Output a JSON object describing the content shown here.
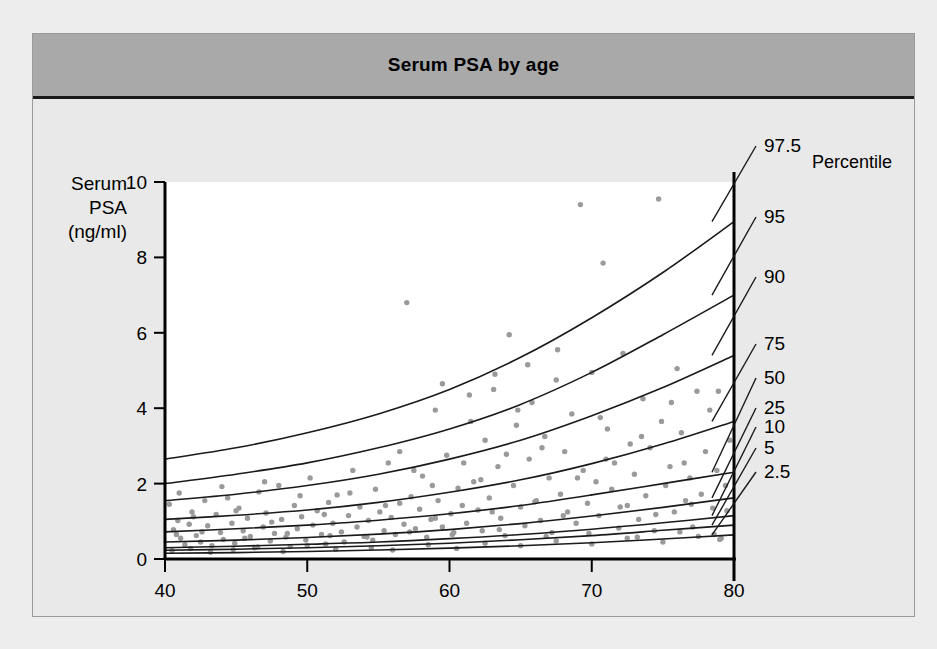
{
  "figure": {
    "title": "Serum PSA by age",
    "background": "#e9e9e9",
    "title_bar_color": "#a9a9a9"
  },
  "chart_data": {
    "type": "scatter",
    "title": "Serum PSA by age",
    "xlabel": "Age (years)",
    "ylabel": "Serum PSA (ng/ml)",
    "ylabel_lines": [
      "Serum",
      "PSA",
      "(ng/ml)"
    ],
    "xlim": [
      40,
      80
    ],
    "ylim": [
      0,
      10
    ],
    "xticks": [
      40,
      50,
      60,
      70,
      80
    ],
    "yticks": [
      0,
      2,
      4,
      6,
      8,
      10
    ],
    "grid": false,
    "legend_position": "right-outside",
    "legend_title": "Percentile",
    "point_color": "#9a9a9a",
    "curve_color": "#1a1a1a",
    "series": [
      {
        "name": "97.5",
        "label": "97.5",
        "x": [
          40,
          45,
          50,
          55,
          60,
          65,
          70,
          75,
          80
        ],
        "values": [
          2.65,
          2.95,
          3.35,
          3.85,
          4.5,
          5.35,
          6.4,
          7.6,
          8.95
        ]
      },
      {
        "name": "95",
        "label": "95",
        "x": [
          40,
          45,
          50,
          55,
          60,
          65,
          70,
          75,
          80
        ],
        "values": [
          2.0,
          2.25,
          2.55,
          2.95,
          3.45,
          4.1,
          4.95,
          5.95,
          7.0
        ]
      },
      {
        "name": "90",
        "label": "90",
        "x": [
          40,
          45,
          50,
          55,
          60,
          65,
          70,
          75,
          80
        ],
        "values": [
          1.55,
          1.72,
          1.95,
          2.25,
          2.65,
          3.15,
          3.8,
          4.55,
          5.4
        ]
      },
      {
        "name": "75",
        "label": "75",
        "x": [
          40,
          45,
          50,
          55,
          60,
          65,
          70,
          75,
          80
        ],
        "values": [
          1.05,
          1.16,
          1.3,
          1.5,
          1.77,
          2.1,
          2.53,
          3.05,
          3.65
        ]
      },
      {
        "name": "50",
        "label": "50",
        "x": [
          40,
          45,
          50,
          55,
          60,
          65,
          70,
          75,
          80
        ],
        "values": [
          0.72,
          0.8,
          0.9,
          1.03,
          1.2,
          1.42,
          1.7,
          2.0,
          2.3
        ]
      },
      {
        "name": "25",
        "label": "25",
        "x": [
          40,
          45,
          50,
          55,
          60,
          65,
          70,
          75,
          80
        ],
        "values": [
          0.45,
          0.5,
          0.57,
          0.66,
          0.78,
          0.94,
          1.14,
          1.37,
          1.62
        ]
      },
      {
        "name": "10",
        "label": "10",
        "x": [
          40,
          45,
          50,
          55,
          60,
          65,
          70,
          75,
          80
        ],
        "values": [
          0.3,
          0.34,
          0.39,
          0.45,
          0.54,
          0.65,
          0.79,
          0.96,
          1.15
        ]
      },
      {
        "name": "5",
        "label": "5",
        "x": [
          40,
          45,
          50,
          55,
          60,
          65,
          70,
          75,
          80
        ],
        "values": [
          0.23,
          0.26,
          0.3,
          0.35,
          0.42,
          0.51,
          0.62,
          0.76,
          0.9
        ]
      },
      {
        "name": "2.5",
        "label": "2.5",
        "x": [
          40,
          45,
          50,
          55,
          60,
          65,
          70,
          75,
          80
        ],
        "values": [
          0.15,
          0.17,
          0.2,
          0.24,
          0.29,
          0.35,
          0.43,
          0.53,
          0.64
        ]
      }
    ],
    "scatter_points": [
      [
        40.3,
        1.45
      ],
      [
        40.6,
        0.78
      ],
      [
        40.9,
        1.02
      ],
      [
        41.1,
        0.55
      ],
      [
        41.4,
        0.38
      ],
      [
        41.7,
        0.92
      ],
      [
        41.9,
        1.25
      ],
      [
        42.2,
        0.62
      ],
      [
        42.5,
        0.45
      ],
      [
        42.8,
        1.55
      ],
      [
        43.0,
        0.88
      ],
      [
        43.3,
        0.35
      ],
      [
        43.6,
        1.18
      ],
      [
        43.9,
        0.7
      ],
      [
        44.1,
        0.52
      ],
      [
        44.4,
        1.62
      ],
      [
        44.7,
        0.95
      ],
      [
        44.9,
        0.42
      ],
      [
        45.2,
        1.35
      ],
      [
        45.5,
        0.75
      ],
      [
        45.8,
        1.08
      ],
      [
        46.0,
        0.6
      ],
      [
        46.3,
        0.3
      ],
      [
        46.6,
        1.78
      ],
      [
        46.9,
        0.85
      ],
      [
        47.1,
        1.22
      ],
      [
        47.4,
        0.48
      ],
      [
        47.7,
        0.68
      ],
      [
        48.0,
        1.95
      ],
      [
        48.2,
        1.05
      ],
      [
        48.5,
        0.58
      ],
      [
        48.8,
        0.33
      ],
      [
        49.1,
        1.42
      ],
      [
        49.3,
        0.8
      ],
      [
        49.6,
        1.12
      ],
      [
        49.9,
        0.5
      ],
      [
        50.2,
        2.15
      ],
      [
        50.4,
        0.9
      ],
      [
        50.7,
        1.28
      ],
      [
        51.0,
        0.65
      ],
      [
        51.3,
        0.4
      ],
      [
        51.5,
        1.5
      ],
      [
        51.8,
        0.95
      ],
      [
        52.1,
        1.7
      ],
      [
        52.4,
        0.72
      ],
      [
        52.6,
        0.45
      ],
      [
        52.9,
        1.15
      ],
      [
        53.2,
        2.35
      ],
      [
        53.5,
        0.85
      ],
      [
        53.7,
        1.38
      ],
      [
        54.0,
        0.6
      ],
      [
        54.3,
        1.02
      ],
      [
        54.6,
        0.5
      ],
      [
        54.8,
        1.85
      ],
      [
        55.1,
        1.25
      ],
      [
        55.4,
        0.75
      ],
      [
        55.7,
        2.55
      ],
      [
        55.9,
        1.1
      ],
      [
        56.2,
        0.65
      ],
      [
        56.5,
        1.48
      ],
      [
        56.8,
        0.92
      ],
      [
        57.0,
        6.8
      ],
      [
        57.3,
        1.65
      ],
      [
        57.6,
        0.8
      ],
      [
        57.9,
        1.32
      ],
      [
        58.1,
        2.2
      ],
      [
        58.4,
        0.58
      ],
      [
        58.7,
        1.05
      ],
      [
        59.0,
        3.95
      ],
      [
        59.2,
        1.55
      ],
      [
        59.5,
        0.85
      ],
      [
        59.8,
        2.75
      ],
      [
        60.1,
        1.2
      ],
      [
        60.3,
        0.7
      ],
      [
        60.6,
        1.88
      ],
      [
        60.9,
        1.42
      ],
      [
        61.2,
        0.95
      ],
      [
        61.4,
        4.35
      ],
      [
        61.7,
        2.05
      ],
      [
        62.0,
        1.3
      ],
      [
        62.3,
        0.75
      ],
      [
        62.5,
        3.15
      ],
      [
        62.8,
        1.62
      ],
      [
        63.1,
        4.5
      ],
      [
        63.4,
        2.45
      ],
      [
        63.6,
        1.08
      ],
      [
        63.9,
        0.62
      ],
      [
        64.2,
        5.95
      ],
      [
        64.5,
        1.95
      ],
      [
        64.7,
        3.55
      ],
      [
        65.0,
        1.38
      ],
      [
        65.3,
        0.88
      ],
      [
        65.6,
        2.65
      ],
      [
        65.8,
        4.15
      ],
      [
        66.1,
        1.55
      ],
      [
        66.4,
        1.02
      ],
      [
        66.7,
        3.25
      ],
      [
        67.0,
        2.15
      ],
      [
        67.2,
        0.7
      ],
      [
        67.5,
        4.75
      ],
      [
        67.8,
        1.72
      ],
      [
        68.1,
        2.85
      ],
      [
        68.3,
        1.25
      ],
      [
        68.6,
        3.85
      ],
      [
        68.9,
        0.95
      ],
      [
        69.2,
        9.4
      ],
      [
        69.4,
        2.35
      ],
      [
        69.7,
        1.48
      ],
      [
        70.0,
        4.95
      ],
      [
        70.3,
        2.05
      ],
      [
        70.5,
        1.15
      ],
      [
        70.8,
        7.85
      ],
      [
        71.1,
        3.45
      ],
      [
        71.4,
        1.85
      ],
      [
        71.6,
        2.55
      ],
      [
        71.9,
        0.82
      ],
      [
        72.2,
        5.45
      ],
      [
        72.5,
        1.42
      ],
      [
        72.7,
        3.05
      ],
      [
        73.0,
        2.25
      ],
      [
        73.3,
        1.05
      ],
      [
        73.6,
        4.25
      ],
      [
        73.8,
        1.68
      ],
      [
        74.1,
        2.95
      ],
      [
        74.4,
        0.75
      ],
      [
        74.7,
        9.55
      ],
      [
        74.9,
        3.65
      ],
      [
        75.2,
        1.95
      ],
      [
        75.5,
        2.45
      ],
      [
        75.8,
        1.25
      ],
      [
        76.0,
        5.05
      ],
      [
        76.3,
        3.35
      ],
      [
        76.6,
        1.55
      ],
      [
        76.9,
        2.15
      ],
      [
        77.1,
        0.85
      ],
      [
        77.4,
        4.45
      ],
      [
        77.7,
        1.72
      ],
      [
        78.0,
        2.85
      ],
      [
        78.3,
        3.95
      ],
      [
        78.5,
        1.35
      ],
      [
        78.8,
        2.35
      ],
      [
        79.1,
        0.55
      ],
      [
        79.4,
        1.95
      ],
      [
        79.7,
        3.15
      ],
      [
        40.5,
        0.22
      ],
      [
        41.8,
        0.28
      ],
      [
        43.2,
        0.18
      ],
      [
        44.8,
        0.25
      ],
      [
        46.5,
        0.32
      ],
      [
        48.3,
        0.2
      ],
      [
        50.0,
        0.35
      ],
      [
        52.0,
        0.26
      ],
      [
        54.5,
        0.3
      ],
      [
        56.0,
        0.24
      ],
      [
        58.5,
        0.38
      ],
      [
        60.5,
        0.28
      ],
      [
        62.5,
        0.42
      ],
      [
        65.0,
        0.35
      ],
      [
        67.5,
        0.48
      ],
      [
        70.0,
        0.4
      ],
      [
        72.5,
        0.55
      ],
      [
        75.0,
        0.45
      ],
      [
        77.5,
        0.6
      ],
      [
        79.0,
        0.52
      ],
      [
        41.0,
        1.75
      ],
      [
        44.0,
        1.92
      ],
      [
        47.0,
        2.05
      ],
      [
        49.5,
        1.68
      ],
      [
        53.0,
        1.75
      ],
      [
        57.5,
        2.35
      ],
      [
        61.0,
        2.55
      ],
      [
        64.0,
        2.78
      ],
      [
        66.5,
        2.95
      ],
      [
        69.0,
        2.15
      ],
      [
        71.0,
        2.65
      ],
      [
        73.5,
        3.25
      ],
      [
        76.5,
        2.55
      ],
      [
        78.9,
        4.45
      ],
      [
        42.0,
        1.12
      ],
      [
        45.0,
        1.28
      ],
      [
        47.5,
        0.98
      ],
      [
        51.2,
        1.18
      ],
      [
        55.5,
        1.42
      ],
      [
        59.0,
        1.08
      ],
      [
        63.0,
        1.25
      ],
      [
        66.0,
        1.52
      ],
      [
        68.0,
        1.15
      ],
      [
        72.0,
        1.38
      ],
      [
        74.5,
        1.18
      ],
      [
        77.0,
        1.45
      ],
      [
        79.5,
        1.28
      ],
      [
        40.8,
        0.65
      ],
      [
        42.6,
        0.72
      ],
      [
        45.6,
        0.55
      ],
      [
        48.6,
        0.68
      ],
      [
        51.6,
        0.62
      ],
      [
        54.2,
        0.58
      ],
      [
        57.2,
        0.72
      ],
      [
        60.2,
        0.65
      ],
      [
        63.5,
        0.78
      ],
      [
        66.8,
        0.6
      ],
      [
        69.8,
        0.68
      ],
      [
        73.2,
        0.58
      ],
      [
        76.2,
        0.72
      ],
      [
        78.6,
        0.65
      ],
      [
        59.5,
        4.65
      ],
      [
        63.2,
        4.9
      ],
      [
        64.8,
        3.95
      ],
      [
        67.6,
        5.55
      ],
      [
        70.6,
        3.75
      ],
      [
        75.6,
        4.15
      ],
      [
        62.2,
        2.1
      ],
      [
        58.8,
        1.95
      ],
      [
        56.5,
        2.85
      ],
      [
        61.5,
        3.65
      ],
      [
        65.5,
        5.15
      ]
    ]
  },
  "axes": {
    "percentile_header": "Percentile",
    "x_axis_title": "Age (years)"
  }
}
